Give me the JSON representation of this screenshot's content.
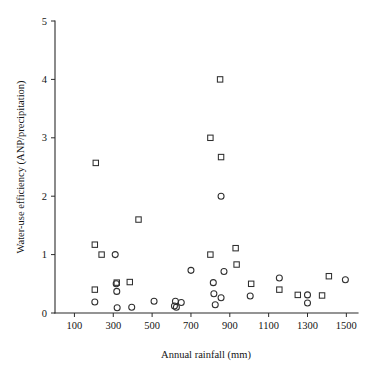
{
  "chart_data": {
    "type": "scatter",
    "title": "",
    "xlabel": "Annual rainfall (mm)",
    "ylabel": "Water-use efficiency (ANP/precipitation)",
    "xlim": [
      0,
      1560
    ],
    "ylim": [
      0,
      5
    ],
    "xticks": [
      100,
      300,
      500,
      700,
      900,
      1100,
      1300,
      1500
    ],
    "xticklabels": [
      "100",
      "300",
      "500",
      "700",
      "900",
      "1100",
      "1300",
      "1500"
    ],
    "yticks": [
      0,
      1,
      2,
      3,
      4,
      5
    ],
    "yticklabels": [
      "0",
      "1",
      "2",
      "3",
      "4",
      "5"
    ],
    "grid": false,
    "legend": "none",
    "marker_color": "#2f2f2f",
    "background_color": "#ffffff",
    "series": [
      {
        "name": "squares",
        "marker": "square",
        "points": [
          [
            210,
            2.57
          ],
          [
            205,
            1.17
          ],
          [
            240,
            1.0
          ],
          [
            205,
            0.4
          ],
          [
            318,
            0.52
          ],
          [
            385,
            0.53
          ],
          [
            430,
            1.6
          ],
          [
            800,
            1.0
          ],
          [
            800,
            3.0
          ],
          [
            850,
            4.0
          ],
          [
            855,
            2.67
          ],
          [
            930,
            1.11
          ],
          [
            935,
            0.83
          ],
          [
            1010,
            0.5
          ],
          [
            1155,
            0.4
          ],
          [
            1250,
            0.31
          ],
          [
            1375,
            0.3
          ],
          [
            1410,
            0.63
          ]
        ]
      },
      {
        "name": "circles",
        "marker": "circle",
        "points": [
          [
            205,
            0.19
          ],
          [
            310,
            1.0
          ],
          [
            315,
            0.5
          ],
          [
            318,
            0.37
          ],
          [
            320,
            0.09
          ],
          [
            395,
            0.1
          ],
          [
            510,
            0.2
          ],
          [
            615,
            0.12
          ],
          [
            620,
            0.2
          ],
          [
            625,
            0.1
          ],
          [
            650,
            0.18
          ],
          [
            700,
            0.73
          ],
          [
            815,
            0.52
          ],
          [
            818,
            0.33
          ],
          [
            825,
            0.14
          ],
          [
            855,
            0.26
          ],
          [
            855,
            2.0
          ],
          [
            870,
            0.71
          ],
          [
            1005,
            0.29
          ],
          [
            1155,
            0.6
          ],
          [
            1300,
            0.31
          ],
          [
            1300,
            0.17
          ],
          [
            1495,
            0.57
          ]
        ]
      }
    ]
  },
  "layout": {
    "plot_left_px": 55,
    "plot_right_px": 358,
    "plot_bottom_px": 313,
    "plot_top_px": 21
  }
}
